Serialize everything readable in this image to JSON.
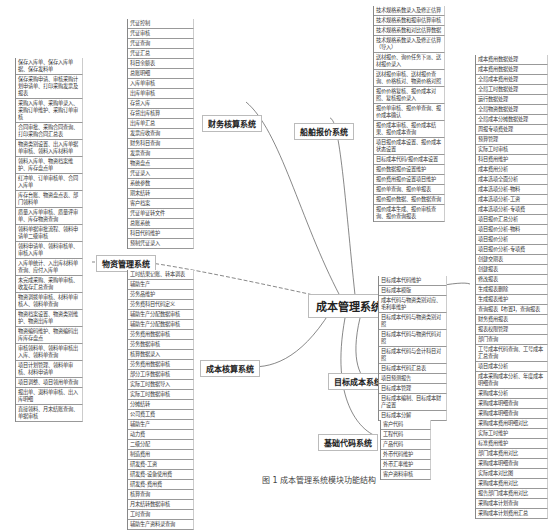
{
  "root": {
    "label": "成本管理系统"
  },
  "branches": {
    "finance": {
      "label": "财务核算系统",
      "items": [
        "凭证控制",
        "凭证审核",
        "凭证查询",
        "凭证汇总",
        "科目余额表",
        "总账明细",
        "入库单审核",
        "出库单审核",
        "存货入库",
        "存货出库核算",
        "出库单汇总",
        "发票应收查询",
        "财务科目查询",
        "发票查询",
        "物资盘点",
        "凭证录入",
        "系统参数",
        "期末结转",
        "客户档案",
        "凭证单证转文件",
        "总账系统",
        "科目代码维护",
        "预制凭证录入"
      ]
    },
    "material": {
      "label": "物资管理系统",
      "items": [
        "保存入库单、保存入库单据、保存发料单",
        "保存采购申请、审核采购计划申请单、打印采购发票及报表",
        "采购入库单、采购单录入、采购订单维护、采购订单审核",
        "合同审批、采购合同查询、打印采购合同汇总表",
        "物资类别设置、出入库单据单审核、领料入库材料单",
        "领料入库单、物资档案维护、库存盘点单",
        "红冲单、订单审核单、合同入库单",
        "库存台账、物资盘点表、部门领料单",
        "质量入库单审核、质量评审单、库存物资查询",
        "领料单据审批流程、领料申请单二级审核",
        "领料申请单、领料审核单、审核入库单",
        "入库单统计、入出库材料单查询、应付入库单",
        "未完成采购、采购单审核、收发存汇总查询",
        "物资调拨单审核、材料单审核人、领料单查询",
        "物资档案设置、物资类别维护、物资出库单",
        "物资编码维护、物资编码出库库存盘点",
        "审核领料单、领料单审核出入库、领料单查询",
        "项目计划管理、领料单审核、材料申请单",
        "项目调整、项目领用单查询",
        "报出单、退料单审核、出入库明细",
        "直接领料、月末结账查询、单据审核"
      ]
    },
    "costAccounting": {
      "label": "成本核算系统",
      "items": [
        "工时结果记账、转本调表",
        "辅助生产",
        "劳务品维护",
        "劳务费科目代码定义",
        "辅助生产分配数据审核",
        "辅助生产分配数据审核",
        "劳务费用数据审核",
        "劳务数据审核",
        "核算数据录入",
        "劳务费用数据审核",
        "部分工序数据审核",
        "实际工时数据导入",
        "实际工时数据审核",
        "分摊结转",
        "公司费工费",
        "辅助生产",
        "动力费",
        "二级分配",
        "制造费用",
        "研发费-工资",
        "研发费-设备使用费",
        "研发费-费用费",
        "核算查询",
        "月末结转数据审核",
        "工时查询",
        "辅助生产资料录查询"
      ]
    },
    "shipQuotation": {
      "label": "船舶报价系统",
      "items": [
        "技术规格系数录入及修正估算",
        "技术规格系数和报审估算审核",
        "技术规格系数和对比估算数据",
        "技术规格系数录入及修正估算（导入）",
        "送材报价、询价任务下派、送材报价录入",
        "送材报价审核、送材报价查询、价格核对、物资价格对照",
        "报价价格复核、报价成本对照、复核报价录入",
        "报价单审核、报价单查询、报价成本确认",
        "报价成本审核、报价成本结果、报价成本查询",
        "项目报价成本设置、报价成本状态设置",
        "目标成本代码/报价成本设置",
        "报价数据报价设置维护",
        "报价费用报价设置项目维护",
        "报价单查询、报价单报表",
        "报价报价数据、报价数据查询",
        "报价成本生成、报价审核查询、报价查询报表"
      ]
    },
    "costAnalysis": {
      "label": "成本分析系统",
      "items": [
        "成本费用数据处理",
        "成本费用数据处理",
        "全局成本费用处理",
        "全局工时数据处理",
        "运行数据处理",
        "全局物资数据处理",
        "全局成本分摊数据处理",
        "周报专项费处理",
        "预算管理",
        "实际工时审核",
        "科目费用维护",
        "成本费用分析",
        "成本选项全面分析",
        "成本选项分析-物料",
        "成本选项分析-工资",
        "成本选项分析-专项费",
        "项目报价汇总分析",
        "项目报价分析-物料",
        "项目报价分析",
        "项目报价分析-专项费",
        "创建交期表",
        "创建报表",
        "修改报表",
        "生成报表删除",
        "生成报表维护",
        "查询报表【布置】，查询报表",
        "财务费用报表",
        "报表权限管理",
        "部门查询",
        "工号成本代码查询、工号成本汇总查询",
        "项目成本分析",
        "成本采购成本分析、年度成本明细查询",
        "采购成本分析",
        "采购成本明细查询",
        "采购成本明细查询",
        "采购成本费用明细对比",
        "实际工时维护",
        "标准费用维护",
        "部门成本费用对比",
        "采购成本明细查询",
        "实际成本对比图",
        "采购成本费用对比",
        "报告部门成本费用对比",
        "采购成本计划查询",
        "采购成本计划费用汇总"
      ]
    },
    "targetCost": {
      "label": "目标成本系统",
      "items": [
        "目标成本代码维护",
        "目标成本模版",
        "成本代码与物资类别对应、毛利率维护",
        "目标成本代码与物资类别对照",
        "目标成本代码与物资代码对照",
        "目标成本代码与会计科目对照",
        "目标成本代码汇总表",
        "项目预测报告",
        "目标成本管理",
        "目标成本编制、目标成本财产设置",
        "目标成本分解"
      ]
    },
    "baseCode": {
      "label": "基础代码系统",
      "items": [
        "客户代码",
        "工程代码",
        "产品代码",
        "外币代码维护",
        "外币汇率维护",
        "客户资料审核"
      ]
    }
  },
  "caption": "图 1 成本管理系统模块功能结构"
}
